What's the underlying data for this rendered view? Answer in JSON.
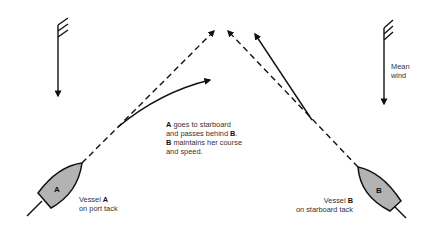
{
  "diagram": {
    "wind": {
      "label_line1": "Mean",
      "label_line2": "wind"
    },
    "vessel_a": {
      "letter": "A",
      "caption_prefix": "Vessel ",
      "caption_bold": "A",
      "caption_line2": "on port tack",
      "hull_color": "#b3b3b3"
    },
    "vessel_b": {
      "letter": "B",
      "caption_prefix": "Vessel ",
      "caption_bold": "B",
      "caption_line2": "on starboard tack",
      "hull_color": "#b3b3b3"
    },
    "explanation": {
      "line1_bold": "A",
      "line1_rest": " goes to starboard",
      "line2_rest": "and passes behind ",
      "line2_bold": "B",
      "line2_end": ".",
      "line3_bold": "B",
      "line3_rest": " maintains her course",
      "line4": "and speed."
    },
    "colors": {
      "line": "#111111",
      "hull": "#b3b3b3",
      "text": "#333333"
    }
  }
}
